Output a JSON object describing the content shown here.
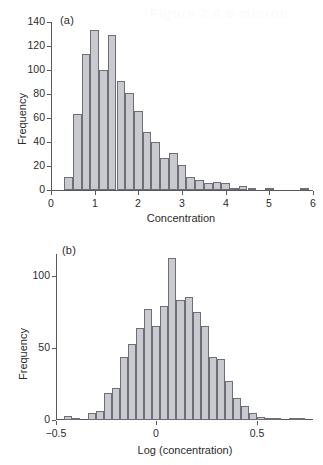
{
  "figure": {
    "background_color": "#ffffff",
    "bar_fill_color": "#c9cad0",
    "bar_edge_color": "#6e6f76",
    "axis_color": "#5a5a5a",
    "text_color": "#2b2b2b",
    "faint_bleedthrough_text": "Figure 2.4 b  microb"
  },
  "chart_data": [
    {
      "type": "bar",
      "panel_tag": "(a)",
      "title": "",
      "xlabel": "Concentration",
      "ylabel": "Frequency",
      "xlim": [
        0,
        6
      ],
      "ylim": [
        0,
        140
      ],
      "xticks": [
        0,
        1,
        2,
        3,
        4,
        5,
        6
      ],
      "xticklabels": [
        "0",
        "1",
        "2",
        "3",
        "4",
        "5",
        "6"
      ],
      "yticks": [
        0,
        20,
        40,
        60,
        80,
        100,
        120,
        140
      ],
      "yticklabels": [
        "0",
        "20",
        "40",
        "60",
        "80",
        "100",
        "120",
        "140"
      ],
      "grid": false,
      "legend": "none",
      "bin_width": 0.2,
      "bin_starts": [
        0.3,
        0.5,
        0.7,
        0.9,
        1.1,
        1.3,
        1.5,
        1.7,
        1.9,
        2.1,
        2.3,
        2.5,
        2.7,
        2.9,
        3.1,
        3.3,
        3.5,
        3.7,
        3.9,
        4.1,
        4.3,
        4.5,
        4.7,
        4.9,
        5.1,
        5.7
      ],
      "values": [
        11,
        63,
        113,
        133,
        100,
        129,
        91,
        81,
        66,
        48,
        40,
        27,
        31,
        21,
        11,
        8,
        6,
        7,
        6,
        1,
        3,
        1,
        0,
        1,
        0,
        1
      ]
    },
    {
      "type": "bar",
      "panel_tag": "(b)",
      "title": "",
      "xlabel": "Log (concentration)",
      "ylabel": "Frequency",
      "xlim": [
        -0.5,
        0.78
      ],
      "ylim": [
        0,
        115
      ],
      "xticks": [
        -0.5,
        0,
        0.5
      ],
      "xticklabels": [
        "−0.5",
        "0",
        "0.5"
      ],
      "yticks": [
        0,
        50,
        100
      ],
      "yticklabels": [
        "0",
        "50",
        "100"
      ],
      "grid": false,
      "legend": "none",
      "bin_width": 0.04,
      "bin_starts": [
        -0.46,
        -0.42,
        -0.38,
        -0.34,
        -0.3,
        -0.26,
        -0.22,
        -0.18,
        -0.14,
        -0.1,
        -0.06,
        -0.02,
        0.02,
        0.06,
        0.1,
        0.14,
        0.18,
        0.22,
        0.26,
        0.3,
        0.34,
        0.38,
        0.42,
        0.46,
        0.5,
        0.54,
        0.58,
        0.62,
        0.66,
        0.7
      ],
      "values": [
        3,
        1,
        0,
        5,
        6,
        19,
        22,
        44,
        53,
        64,
        77,
        65,
        79,
        112,
        83,
        85,
        75,
        65,
        44,
        42,
        27,
        15,
        10,
        5,
        2,
        1,
        1,
        0,
        1,
        1
      ]
    }
  ]
}
